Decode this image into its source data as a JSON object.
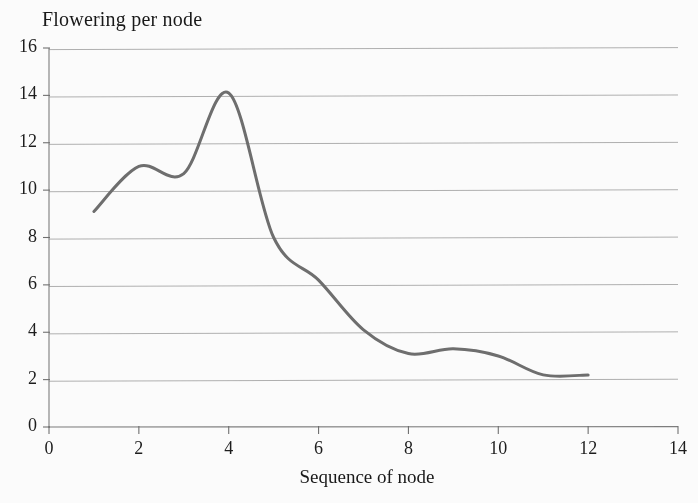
{
  "chart_data": {
    "type": "line",
    "title": "",
    "ylabel": "Flowering per node",
    "xlabel": "Sequence of node",
    "x": [
      1,
      2,
      3,
      4,
      5,
      6,
      7,
      8,
      9,
      10,
      11,
      12
    ],
    "values": [
      9.1,
      11.0,
      10.7,
      14.1,
      8.0,
      6.2,
      4.1,
      3.1,
      3.3,
      3.0,
      2.2,
      2.2
    ],
    "series": [
      {
        "name": "Flowering per node",
        "values": [
          9.1,
          11.0,
          10.7,
          14.1,
          8.0,
          6.2,
          4.1,
          3.1,
          3.3,
          3.0,
          2.2,
          2.2
        ]
      }
    ],
    "annotations": [
      "local maximum of about 11.0 at node 2",
      "slight dip to about 10.7 at node 3",
      "global peak of about 14.1 near node 3.9",
      "steep decline between nodes 4 and 5.5",
      "shoulder near 6.2 around node 6",
      "local minimum about 3.0 near node 8.3",
      "small rise to about 3.3 near node 9.6",
      "flattens at about 2.2 from node 11 to 12"
    ],
    "xlim": [
      0,
      14
    ],
    "ylim": [
      0,
      16
    ],
    "xticks": [
      0,
      2,
      4,
      6,
      8,
      10,
      12,
      14
    ],
    "yticks": [
      0,
      2,
      4,
      6,
      8,
      10,
      12,
      14,
      16
    ],
    "xtick_labels": [
      "0",
      "2",
      "4",
      "6",
      "8",
      "10",
      "12",
      "14"
    ],
    "ytick_labels": [
      "0",
      "2",
      "4",
      "6",
      "8",
      "10",
      "12",
      "14",
      "16"
    ],
    "grid": "horizontal",
    "legend": "none",
    "smoothing": "spline",
    "line_color": "#6d6d6d",
    "line_width": 3.0,
    "grid_color": "#8e8e8e",
    "axis_color": "#7d7d7d",
    "background_color": "#ffffff",
    "text_color": "#1a1a1a"
  }
}
